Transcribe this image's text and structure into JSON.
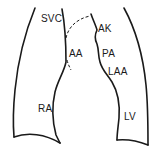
{
  "diagram": {
    "stroke_color": "#1a1a1a",
    "background": "#ffffff",
    "labels": [
      {
        "id": "svc",
        "text": "SVC",
        "x": 41,
        "y": 14
      },
      {
        "id": "aa",
        "text": "AA",
        "x": 69,
        "y": 49
      },
      {
        "id": "ak",
        "text": "AK",
        "x": 98,
        "y": 24
      },
      {
        "id": "pa",
        "text": "PA",
        "x": 102,
        "y": 49
      },
      {
        "id": "laa",
        "text": "LAA",
        "x": 108,
        "y": 67
      },
      {
        "id": "ra",
        "text": "RA",
        "x": 38,
        "y": 104
      },
      {
        "id": "lv",
        "text": "LV",
        "x": 124,
        "y": 112
      }
    ]
  }
}
